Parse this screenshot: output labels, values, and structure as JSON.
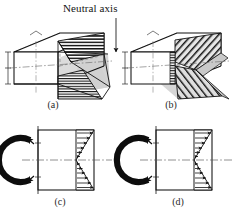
{
  "figure": {
    "kind": "engineering-diagram",
    "annotation_label": "Neutral axis",
    "captions": {
      "a": "(a)",
      "b": "(b)",
      "c": "(c)",
      "d": "(d)"
    },
    "colors": {
      "line": "#111111",
      "shade_gray": "#d6d6d6",
      "shade_gray_dark": "#bdbdbd",
      "centerline": "#555555",
      "moment_arrow": "#0d0d0d",
      "background": "#ffffff"
    }
  },
  "panels": [
    {
      "id": "a",
      "caption": "(a)",
      "view": "3d",
      "title": "Bending stress distribution on box beam with neutral axis",
      "features": [
        "rectangular-box-beam",
        "hatched-bending-stress-wedge",
        "shaded-neutral-plane",
        "hidden-edges-dashed",
        "dimension-ticks-left"
      ],
      "annotated": true
    },
    {
      "id": "b",
      "caption": "(b)",
      "view": "3d",
      "title": "Transverse shear stress distribution on box beam",
      "features": [
        "rectangular-box-beam",
        "hatched-shear-chevron",
        "shaded-shear-surface",
        "hidden-edges-dashed",
        "dimension-ticks-left"
      ],
      "annotated": false
    },
    {
      "id": "c",
      "caption": "(c)",
      "view": "2d-section",
      "title": "Linear bending stress profile with applied moment",
      "features": [
        "moment-crescent-arrow",
        "section-outline",
        "neutral-axis-centerline",
        "linear-triangular-stress-top",
        "linear-triangular-stress-bottom",
        "stress-arrows-right"
      ],
      "stress_profile": "linear",
      "arrow_count_top": 6,
      "arrow_count_bottom": 6
    },
    {
      "id": "d",
      "caption": "(d)",
      "view": "2d-section",
      "title": "Shear stress profile with applied moment",
      "features": [
        "moment-crescent-arrow",
        "section-outline",
        "neutral-axis-centerline",
        "bowtie-shear-stress-top",
        "bowtie-shear-stress-bottom",
        "stress-arrows-right"
      ],
      "stress_profile": "bowtie",
      "arrow_count_top": 6,
      "arrow_count_bottom": 6
    }
  ]
}
